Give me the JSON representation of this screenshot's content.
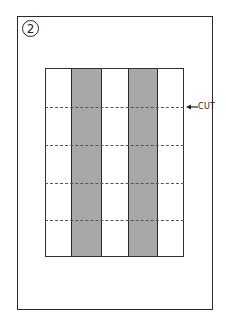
{
  "figure": {
    "step_number": "2",
    "cut_label": "CUT",
    "colors": {
      "border": "#2a2a2a",
      "shaded_stripe": "#a8a8a8",
      "background": "#ffffff",
      "dash": "#555555"
    },
    "stripes": [
      "white",
      "shaded",
      "white",
      "shaded",
      "white"
    ],
    "cut_line_count": 4
  }
}
